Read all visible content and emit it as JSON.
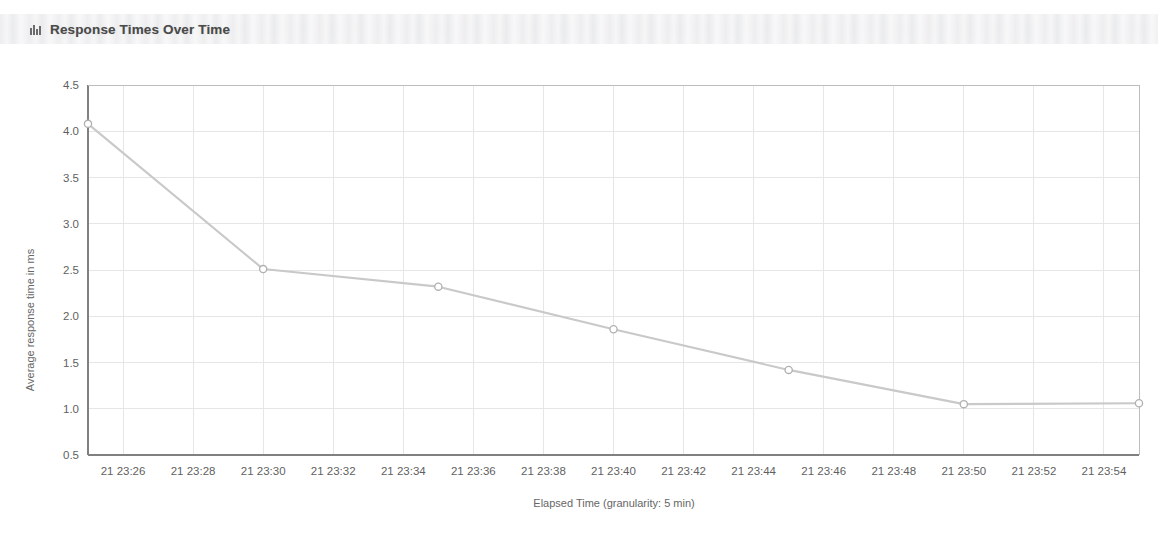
{
  "panel": {
    "title": "Response Times Over Time",
    "icon": "bar-chart-icon"
  },
  "colors": {
    "series_line": "#c9c9c9",
    "marker_stroke": "#b0b0b0",
    "marker_fill": "#ffffff",
    "axis": "#808080",
    "grid": "#e6e6e6",
    "text": "#5f5f5f",
    "header_band": "#f1f1f2"
  },
  "chart_data": {
    "type": "line",
    "title": "Response Times Over Time",
    "xlabel": "Elapsed Time (granularity: 5 min)",
    "ylabel": "Average response time in ms",
    "ylim": [
      0.5,
      4.5
    ],
    "yticks": [
      "0.5",
      "1.0",
      "1.5",
      "2.0",
      "2.5",
      "3.0",
      "3.5",
      "4.0",
      "4.5"
    ],
    "ytick_values": [
      0.5,
      1.0,
      1.5,
      2.0,
      2.5,
      3.0,
      3.5,
      4.0,
      4.5
    ],
    "xticks": [
      "21 23:26",
      "21 23:28",
      "21 23:30",
      "21 23:32",
      "21 23:34",
      "21 23:36",
      "21 23:38",
      "21 23:40",
      "21 23:42",
      "21 23:44",
      "21 23:46",
      "21 23:48",
      "21 23:50",
      "21 23:52",
      "21 23:54"
    ],
    "xtick_minutes": [
      26,
      28,
      30,
      32,
      34,
      36,
      38,
      40,
      42,
      44,
      46,
      48,
      50,
      52,
      54
    ],
    "xlim_minutes": [
      25,
      55
    ],
    "grid": true,
    "legend": "none",
    "series": [
      {
        "name": "Average response time",
        "marker": "circle",
        "x_labels": [
          "21 23:25",
          "21 23:30",
          "21 23:35",
          "21 23:40",
          "21 23:45",
          "21 23:50",
          "21 23:55"
        ],
        "x_minutes": [
          25,
          30,
          35,
          40,
          45,
          50,
          55
        ],
        "values": [
          4.08,
          2.51,
          2.32,
          1.86,
          1.42,
          1.05,
          1.06
        ]
      }
    ]
  }
}
